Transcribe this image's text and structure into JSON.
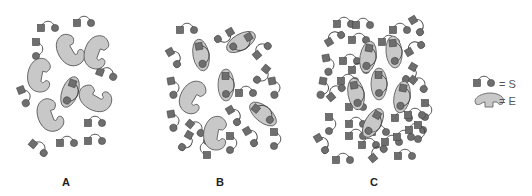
{
  "figure": {
    "title": "",
    "colors": {
      "background": "#ffffff",
      "enzyme_fill": "#c8c8c8",
      "enzyme_stroke": "#555555",
      "substrate_fill": "#6e6e6e",
      "substrate_stroke": "#444444",
      "link": "#444444"
    }
  },
  "panels": [
    {
      "id": "A",
      "label": "A",
      "enzymes_free": 5,
      "enzymes_bound": 1
    },
    {
      "id": "B",
      "label": "B",
      "enzymes_free": 2,
      "enzymes_bound": 4
    },
    {
      "id": "C",
      "label": "C",
      "enzymes_free": 0,
      "enzymes_bound": 6
    }
  ],
  "legend": {
    "items": [
      {
        "symbol": "substrate",
        "text": "= S"
      },
      {
        "symbol": "enzyme",
        "text": "= E"
      }
    ]
  }
}
